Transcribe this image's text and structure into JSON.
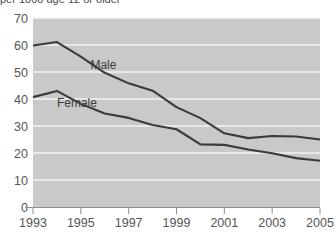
{
  "chart": {
    "subtitle": "per 1000 age 12 or older",
    "title": ""
  },
  "chart_data": {
    "type": "line",
    "title": "",
    "subtitle": "per 1000 age 12 or older",
    "xlabel": "",
    "ylabel": "",
    "x": [
      1993,
      1994,
      1995,
      1996,
      1997,
      1998,
      1999,
      2000,
      2001,
      2002,
      2003,
      2004,
      2005
    ],
    "xlim": [
      1993,
      2005
    ],
    "ylim": [
      0,
      70
    ],
    "yticks": [
      0,
      10,
      20,
      30,
      40,
      50,
      60,
      70
    ],
    "xticks": [
      1993,
      1995,
      1997,
      1999,
      2001,
      2003,
      2005
    ],
    "grid": true,
    "legend_position": "inline-labels",
    "series": [
      {
        "name": "Male",
        "label": "Male",
        "color": "#3a3a3a",
        "values": [
          59.8,
          61.1,
          55.7,
          49.7,
          45.8,
          43.1,
          37.0,
          32.9,
          27.3,
          25.5,
          26.3,
          26.1,
          25.0
        ]
      },
      {
        "name": "Female",
        "label": "Female",
        "color": "#3a3a3a",
        "values": [
          40.7,
          43.0,
          38.2,
          34.6,
          33.0,
          30.4,
          28.8,
          23.2,
          23.0,
          21.3,
          19.9,
          18.1,
          17.1
        ]
      }
    ],
    "annotations": [
      {
        "text": "Male",
        "x": 1995.4,
        "y": 51.0
      },
      {
        "text": "Female",
        "x": 1994.0,
        "y": 37.0
      }
    ]
  },
  "axes": {
    "y_tick_labels": [
      "70",
      "60",
      "50",
      "40",
      "30",
      "20",
      "10",
      "0"
    ],
    "x_tick_labels": [
      "1993",
      "1995",
      "1997",
      "1999",
      "2001",
      "2003",
      "2005"
    ]
  },
  "colors": {
    "plot_background": "#c9c9c9",
    "gridline": "#f2f2f2",
    "line": "#3a3a3a",
    "axis": "#8d8d8d",
    "tick_text": "#555555",
    "page_background": "#ffffff"
  }
}
